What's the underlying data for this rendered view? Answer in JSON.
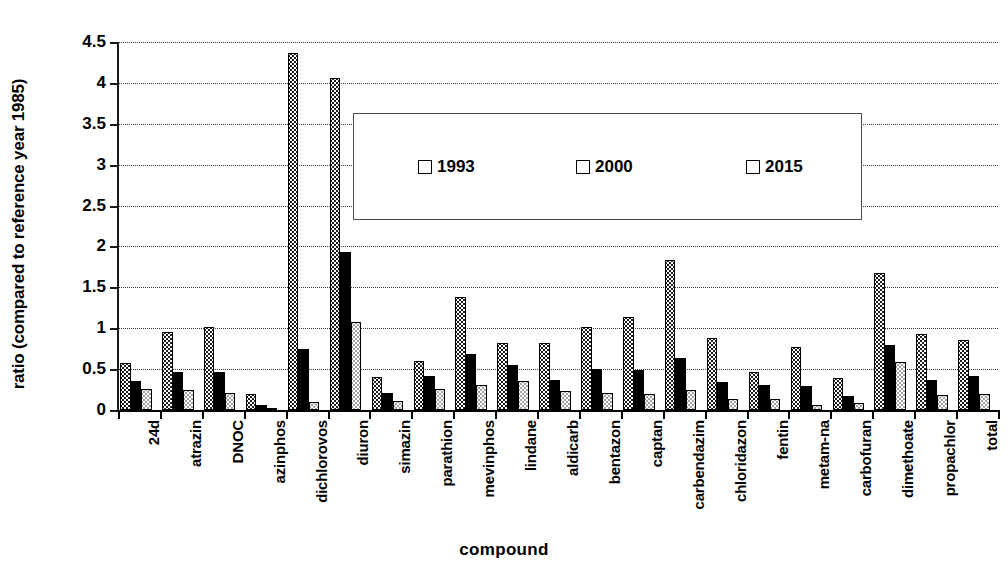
{
  "chart_data": {
    "type": "bar",
    "title": "",
    "xlabel": "compound",
    "ylabel": "ratio (compared to reference year 1985)",
    "ylim": [
      0,
      4.5
    ],
    "ytick_labels": [
      "0",
      "0.5",
      "1",
      "1.5",
      "2",
      "2.5",
      "3",
      "3.5",
      "4",
      "4.5"
    ],
    "yticks": [
      0,
      0.5,
      1,
      1.5,
      2,
      2.5,
      3,
      3.5,
      4,
      4.5
    ],
    "grid": "horizontal-dotted",
    "legend_position": "upper-center-inside",
    "categories": [
      "24d",
      "atrazin",
      "DNOC",
      "azinphos",
      "dichlorovos",
      "diuron",
      "simazin",
      "parathion",
      "mevinphos",
      "lindane",
      "aldicarb",
      "bentazon",
      "captan",
      "carbendazim",
      "chloridazon",
      "fentin",
      "metam-na",
      "carbofuran",
      "dimethoate",
      "propachlor",
      "total"
    ],
    "series": [
      {
        "name": "1993",
        "color": "#1b1b1b",
        "pattern": "dark-dotted",
        "values": [
          0.57,
          0.95,
          1.01,
          0.19,
          4.37,
          4.06,
          0.4,
          0.6,
          1.38,
          0.82,
          0.82,
          1.01,
          1.14,
          1.84,
          0.88,
          0.46,
          0.77,
          0.39,
          1.68,
          0.93,
          0.86
        ]
      },
      {
        "name": "2000",
        "color": "#000000",
        "pattern": "solid-black",
        "values": [
          0.35,
          0.46,
          0.46,
          0.06,
          0.75,
          1.93,
          0.21,
          0.42,
          0.69,
          0.55,
          0.37,
          0.5,
          0.49,
          0.63,
          0.34,
          0.3,
          0.29,
          0.17,
          0.8,
          0.37,
          0.42
        ]
      },
      {
        "name": "2015",
        "color": "#ffffff",
        "pattern": "light-dotted",
        "values": [
          0.26,
          0.24,
          0.21,
          0.03,
          0.1,
          1.08,
          0.11,
          0.26,
          0.31,
          0.36,
          0.23,
          0.21,
          0.2,
          0.25,
          0.14,
          0.14,
          0.06,
          0.08,
          0.59,
          0.18,
          0.2
        ]
      }
    ]
  },
  "legend": {
    "entries": [
      {
        "label": "1993"
      },
      {
        "label": "2000"
      },
      {
        "label": "2015"
      }
    ]
  },
  "axes": {
    "x_title": "compound",
    "y_title": "ratio (compared to reference year 1985)"
  }
}
